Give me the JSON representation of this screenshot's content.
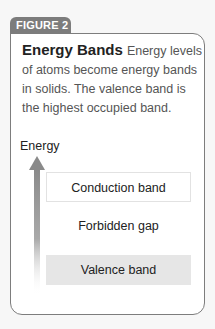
{
  "figure": {
    "tab_label": "FIGURE 2",
    "title": "Energy Bands",
    "caption": "Energy levels of atoms become energy bands in solids. The valence band is the highest occupied band.",
    "colors": {
      "tab_fill": "#7c7c7c",
      "border": "#7d7d7d",
      "valence_fill": "#e6e6e6",
      "arrow": "#8a8a8a"
    }
  },
  "diagram": {
    "axis_label": "Energy",
    "axis_icon": "arrow-up-icon",
    "bands": [
      {
        "label": "Conduction band",
        "style": "outlined"
      },
      {
        "label": "Forbidden gap",
        "style": "text-only"
      },
      {
        "label": "Valence band",
        "style": "filled"
      }
    ]
  }
}
